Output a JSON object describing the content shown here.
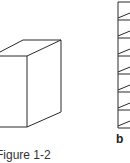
{
  "figure": {
    "caption": "Figure 1-2",
    "panel_label": "b",
    "stroke_color": "#2a2a2a"
  },
  "cube": {
    "front_face": {
      "left": -40,
      "top": 56,
      "right": 27,
      "bottom": 127
    },
    "depth_offset": {
      "dx": 34,
      "dy": -16
    }
  },
  "ladder": {
    "x": 118,
    "rungs_y": [
      2,
      20,
      38,
      56,
      74,
      92,
      110,
      128
    ]
  }
}
